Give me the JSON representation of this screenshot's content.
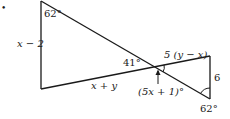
{
  "diagram": {
    "type": "geometry-two-triangles-vertical-angles",
    "stroke_color": "#1a1a1a",
    "background": "#ffffff",
    "vertices": {
      "A_top_left": [
        41,
        1
      ],
      "B_bottom_left": [
        41,
        89
      ],
      "X_intersection": [
        155,
        67
      ],
      "C_top_right": [
        210,
        56
      ],
      "D_bottom_right": [
        210,
        99
      ]
    },
    "labels": {
      "bullet": "•",
      "angle_top_left": "62°",
      "side_left": "x − 2",
      "angle_left_at_intersection": "41°",
      "side_bottom_left": "x + y",
      "side_top_right": "5 (y − x)",
      "side_right": "6",
      "angle_intersection_right": "(5x + 1)°",
      "angle_bottom_right": "62°"
    }
  }
}
